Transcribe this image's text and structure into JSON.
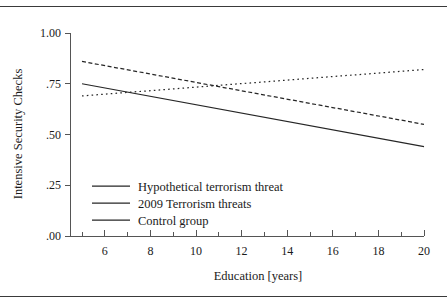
{
  "figure": {
    "caption_fragment": "",
    "background": "#ffffff",
    "ink": "#262626",
    "rules": [
      "top",
      "bottom"
    ]
  },
  "chart_data": {
    "type": "line",
    "title": "",
    "xlabel": "Education [years]",
    "ylabel": "Intensive Security Checks",
    "xlim": [
      5,
      20
    ],
    "ylim": [
      0.0,
      1.0
    ],
    "grid": false,
    "legend_position": "inside-lower-left",
    "xticks": [
      6,
      8,
      10,
      12,
      14,
      16,
      18,
      20
    ],
    "xtick_labels": [
      "6",
      "8",
      "10",
      "12",
      "14",
      "16",
      "18",
      "20"
    ],
    "xminor_ticks": [
      5,
      7,
      9,
      11,
      13,
      15,
      17,
      19
    ],
    "yticks": [
      0.0,
      0.25,
      0.5,
      0.75,
      1.0
    ],
    "ytick_labels": [
      ".00",
      ".25",
      ".50",
      ".75",
      "1.00"
    ],
    "x": [
      5,
      20
    ],
    "series": [
      {
        "name": "Hypothetical terrorism threat",
        "style": "dotted",
        "color": "#262626",
        "values": [
          0.69,
          0.82
        ]
      },
      {
        "name": "2009 Terrorism threats",
        "style": "dashed",
        "color": "#262626",
        "values": [
          0.86,
          0.55
        ]
      },
      {
        "name": "Control group",
        "style": "solid",
        "color": "#262626",
        "values": [
          0.75,
          0.44
        ]
      }
    ]
  }
}
